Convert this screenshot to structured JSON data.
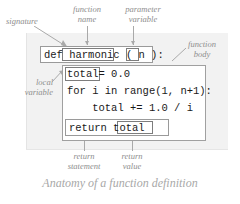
{
  "figure": {
    "caption": "Anatomy of a function definition"
  },
  "code": {
    "signature": {
      "keyword": "def ",
      "function_name": "harmonic",
      "open_paren": " ( ",
      "parameter": "n",
      "close_paren": " ):",
      "full_line": "def harmonic ( n ):"
    },
    "body_lines": [
      "total= 0.0",
      "for i in range(1, n+1):",
      "    total += 1.0 / i",
      "return total"
    ],
    "local_variable": "total",
    "assignment_rest": "= 0.0",
    "for_line": "for i in range(1, n+1):",
    "increment_line": "    total += 1.0 / i",
    "return_keyword": "return ",
    "return_value": "total"
  },
  "annotations": {
    "signature": "signature",
    "function_name": "function\nname",
    "parameter_variable": "parameter\nvariable",
    "function_body": "function\nbody",
    "local_variable": "local\nvariable",
    "return_statement": "return\nstatement",
    "return_value": "return\nvalue"
  },
  "colors": {
    "panel_background": "#f2f2f2",
    "code_text": "#1a1a1a",
    "box_border": "#9a9a9a",
    "annotation_text": "#8e8e8e",
    "caption_text": "#a8a8a8",
    "leader_line": "#a9a9a9"
  }
}
